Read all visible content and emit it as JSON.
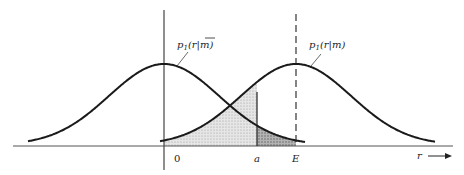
{
  "figure": {
    "type": "two-gaussian-decision-diagram",
    "curves": [
      {
        "id": "p1_r_given_mbar",
        "label_main": "p",
        "label_sub": "1",
        "label_args": "(r|",
        "label_m": "m",
        "label_close": ")",
        "overbar": true,
        "center_label": "0"
      },
      {
        "id": "p1_r_given_m",
        "label_main": "p",
        "label_sub": "1",
        "label_args": "(r|",
        "label_m": "m",
        "label_close": ")",
        "overbar": false,
        "center_label": "E"
      }
    ],
    "axis": {
      "x_label": "r",
      "tick_labels": [
        "0",
        "a",
        "E"
      ]
    },
    "regions": [
      {
        "name": "light-shaded-area",
        "description": "area under p1(r|m) left of threshold a"
      },
      {
        "name": "dark-shaded-area",
        "description": "area under p1(r|mbar) between a and E"
      }
    ],
    "colors": {
      "stroke": "#1a1a1a",
      "light_fill": "#d9d9d9",
      "dark_fill": "#9a9a9a"
    }
  }
}
